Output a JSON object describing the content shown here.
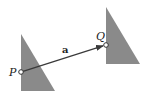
{
  "diagram": {
    "type": "translation-vector",
    "colors": {
      "triangle_fill": "#8a8a8a",
      "vector": "#3a3a3a",
      "point_fill": "#ffffff",
      "point_stroke": "#333333"
    },
    "triangles": [
      {
        "id": "original",
        "points": "21,34 21,91 55,91"
      },
      {
        "id": "translated",
        "points": "106,7 106,64 140,64"
      }
    ],
    "points": {
      "P": {
        "label": "P",
        "x": 21,
        "y": 72
      },
      "Q": {
        "label": "Q",
        "x": 106,
        "y": 45
      }
    },
    "vector": {
      "label": "a",
      "from": "P",
      "to": "Q"
    }
  }
}
